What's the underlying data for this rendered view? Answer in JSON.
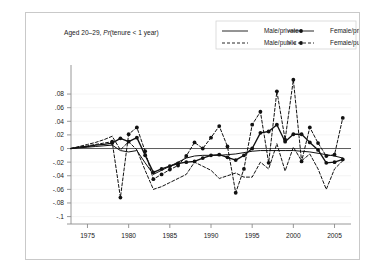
{
  "figure": {
    "title_plain": "Aged 20–29, ",
    "title_italic": "Pr",
    "title_tail": "(tenure < 1 year)",
    "bg_color": "#ffffff",
    "frame_color": "#c9c9c9",
    "ink_color": "#111111"
  },
  "legend": {
    "position": "top-right",
    "entries": [
      {
        "label": "Male/private",
        "style": "solid",
        "marker": false
      },
      {
        "label": "Female/private",
        "style": "solid",
        "marker": true
      },
      {
        "label": "Male/public",
        "style": "dashed",
        "marker": false
      },
      {
        "label": "Female/public",
        "style": "dashed",
        "marker": true
      }
    ]
  },
  "axes": {
    "x_ticks": [
      "1975",
      "1980",
      "1985",
      "1990",
      "1995",
      "2000",
      "2005"
    ],
    "x_tick_values": [
      1975,
      1980,
      1985,
      1990,
      1995,
      2000,
      2005
    ],
    "y_ticks": [
      ".08",
      ".06",
      ".04",
      ".02",
      "0",
      "-.02",
      "-.04",
      "-.06",
      "-.08",
      "-.1"
    ],
    "y_tick_values": [
      0.08,
      0.06,
      0.04,
      0.02,
      0,
      -0.02,
      -0.04,
      -0.06,
      -0.08,
      -0.1
    ],
    "xlim": [
      1973,
      2007
    ],
    "ylim": [
      -0.105,
      0.108
    ],
    "grid": "horizontal-faint",
    "zero_line": true
  },
  "chart_data": {
    "type": "line",
    "title": "Aged 20–29, Pr(tenure < 1 year)",
    "xlabel": "",
    "ylabel": "",
    "xlim": [
      1973,
      2007
    ],
    "ylim": [
      -0.105,
      0.108
    ],
    "x": [
      1973,
      1974,
      1975,
      1976,
      1977,
      1978,
      1979,
      1980,
      1981,
      1982,
      1983,
      1984,
      1985,
      1986,
      1987,
      1988,
      1989,
      1990,
      1991,
      1992,
      1993,
      1994,
      1995,
      1996,
      1997,
      1998,
      1999,
      2000,
      2001,
      2002,
      2003,
      2004,
      2005,
      2006
    ],
    "series": [
      {
        "name": "Male/private",
        "style": "solid",
        "marker": false,
        "width": "thin",
        "values": [
          0.0,
          0.001,
          0.002,
          0.003,
          0.004,
          0.005,
          -0.003,
          -0.005,
          -0.003,
          -0.021,
          -0.038,
          -0.032,
          -0.026,
          -0.02,
          -0.014,
          -0.011,
          -0.01,
          -0.01,
          -0.01,
          -0.009,
          -0.008,
          -0.006,
          -0.004,
          -0.003,
          -0.003,
          -0.003,
          -0.003,
          -0.003,
          -0.004,
          -0.005,
          -0.007,
          -0.009,
          -0.011,
          -0.014
        ]
      },
      {
        "name": "Female/private",
        "style": "solid",
        "marker": true,
        "width": "thick",
        "values": [
          0.0,
          0.002,
          0.003,
          0.005,
          0.006,
          0.008,
          0.015,
          0.01,
          0.016,
          -0.01,
          -0.035,
          -0.03,
          -0.026,
          -0.022,
          -0.02,
          -0.019,
          -0.014,
          -0.01,
          -0.009,
          -0.013,
          -0.017,
          -0.01,
          0.0,
          0.023,
          0.025,
          0.035,
          0.01,
          0.021,
          0.021,
          0.009,
          -0.002,
          -0.021,
          -0.02,
          -0.016
        ]
      },
      {
        "name": "Male/public",
        "style": "dashed",
        "marker": false,
        "width": "thin",
        "values": [
          0.0,
          0.003,
          0.006,
          0.009,
          0.013,
          0.018,
          -0.002,
          0.01,
          -0.002,
          -0.032,
          -0.06,
          -0.056,
          -0.05,
          -0.044,
          -0.038,
          -0.02,
          -0.026,
          -0.032,
          -0.044,
          -0.04,
          -0.036,
          -0.042,
          -0.042,
          -0.02,
          -0.03,
          0.007,
          -0.033,
          0.002,
          -0.018,
          -0.008,
          -0.03,
          -0.06,
          -0.03,
          -0.018
        ]
      },
      {
        "name": "Female/public",
        "style": "dashed",
        "marker": true,
        "width": "thin",
        "values": [
          0.0,
          0.002,
          0.004,
          0.006,
          0.008,
          0.01,
          -0.072,
          0.021,
          0.031,
          -0.004,
          -0.045,
          -0.038,
          -0.031,
          -0.025,
          -0.011,
          0.009,
          0.0,
          0.016,
          0.033,
          0.003,
          -0.065,
          -0.03,
          0.035,
          0.054,
          -0.021,
          0.084,
          0.013,
          0.101,
          -0.019,
          0.031,
          0.008,
          -0.011,
          -0.009,
          0.045
        ]
      }
    ]
  }
}
